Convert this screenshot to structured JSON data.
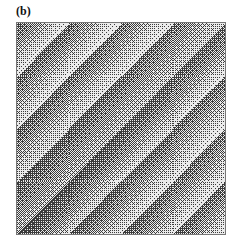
{
  "figure": {
    "panel_label": "(b)",
    "pattern": {
      "orientation": "diagonal (top-left to bottom-right bands)",
      "band_count": 8,
      "dark_band_position": 0.5,
      "min_gray": 0.25,
      "max_gray": 0.92
    }
  }
}
